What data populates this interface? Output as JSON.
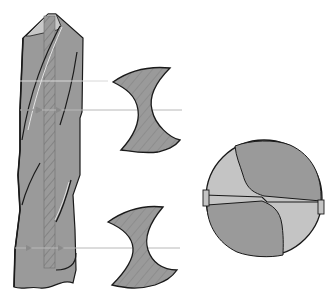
{
  "diagram": {
    "components": [
      {
        "id": "drill-side-view",
        "description": "Side view of twist drill with helical flutes and hatched web core"
      },
      {
        "id": "cross-section-upper",
        "description": "Cross-section of drill body at upper cut line"
      },
      {
        "id": "cross-section-lower",
        "description": "Cross-section of drill body at lower cut line"
      },
      {
        "id": "drill-tip-end-view",
        "description": "End view of drill point showing cutting lips and chisel edge"
      }
    ],
    "colors": {
      "body": "#9a9a9a",
      "body_light": "#c4c4c4",
      "outline": "#1a1a1a",
      "guide_line": "#b8b8b8",
      "arrow": "#8a8a8a",
      "background": "#ffffff"
    }
  }
}
